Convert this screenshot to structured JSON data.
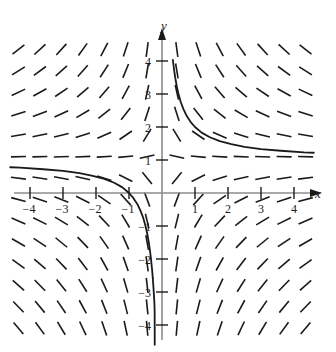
{
  "figure": {
    "title": "",
    "background_color": "#ffffff",
    "width": 336,
    "height": 352
  },
  "axes": {
    "x_axis_label": "x",
    "y_axis_label": "y",
    "x_axis_color": "#8c8c8c",
    "y_axis_color": "#8c8c8c",
    "arrow_color": "#1a1a1a",
    "origin_px": [
      162,
      193
    ],
    "unit_px": 33,
    "x_ticks": [
      {
        "value": -4,
        "label": "−4"
      },
      {
        "value": -3,
        "label": "−3"
      },
      {
        "value": -2,
        "label": "−2"
      },
      {
        "value": -1,
        "label": "−1"
      },
      {
        "value": 1,
        "label": "1"
      },
      {
        "value": 2,
        "label": "2"
      },
      {
        "value": 3,
        "label": "3"
      },
      {
        "value": 4,
        "label": "4"
      }
    ],
    "y_ticks": [
      {
        "value": 4,
        "label": "4"
      },
      {
        "value": 3,
        "label": "3"
      },
      {
        "value": 2,
        "label": "2"
      },
      {
        "value": 1,
        "label": "1"
      },
      {
        "value": -1,
        "label": "−1"
      },
      {
        "value": -2,
        "label": "−2"
      },
      {
        "value": -3,
        "label": "−3"
      },
      {
        "value": -4,
        "label": "−4"
      }
    ]
  },
  "chart_data": {
    "type": "line",
    "title": "",
    "subtitle": "",
    "xlabel": "x",
    "ylabel": "y",
    "xlim": [
      -4.6,
      4.6
    ],
    "ylim": [
      -4.6,
      4.6
    ],
    "grid": false,
    "legend": "none",
    "plot_kind": "slope-field-with-solution-curve",
    "slope_field": {
      "description": "Short line segments showing dy/dx = (1 - y)/x at each lattice point",
      "segment_color": "#1a1a1a",
      "segment_length_px": 15,
      "segment_width_px": 1.6,
      "x_samples": [
        -4.35,
        -3.7,
        -3.05,
        -2.4,
        -1.75,
        -1.1,
        -0.45,
        0.45,
        1.1,
        1.75,
        2.4,
        3.05,
        3.7,
        4.35
      ],
      "y_samples": [
        4.35,
        3.7,
        3.05,
        2.4,
        1.75,
        1.1,
        0.45,
        -0.2,
        -0.85,
        -1.5,
        -2.15,
        -2.8,
        -3.45,
        -4.1
      ],
      "formula": "dy/dx = (1 - y)/x"
    },
    "series": [
      {
        "name": "solution curve",
        "style": "solid",
        "color": "#1a1a1a",
        "width_px": 1.8,
        "equation": "y = 1 + 1/x",
        "asymptotes": {
          "horizontal": 1,
          "vertical": 0
        },
        "branches": [
          {
            "name": "right-branch",
            "x": [
              0.33,
              0.36,
              0.4,
              0.45,
              0.5,
              0.57,
              0.65,
              0.75,
              0.87,
              1.0,
              1.2,
              1.45,
              1.75,
              2.1,
              2.5,
              3.0,
              3.6,
              4.3,
              4.6
            ],
            "y": [
              4.03,
              3.78,
              3.5,
              3.22,
              3.0,
              2.75,
              2.54,
              2.33,
              2.15,
              2.0,
              1.83,
              1.69,
              1.57,
              1.48,
              1.4,
              1.33,
              1.28,
              1.23,
              1.22
            ]
          },
          {
            "name": "left-branch",
            "x": [
              -4.6,
              -4.3,
              -3.6,
              -3.0,
              -2.5,
              -2.1,
              -1.75,
              -1.45,
              -1.2,
              -1.0,
              -0.87,
              -0.75,
              -0.65,
              -0.57,
              -0.5,
              -0.45,
              -0.4,
              -0.36,
              -0.33,
              -0.3,
              -0.28
            ],
            "y": [
              0.78,
              0.77,
              0.72,
              0.67,
              0.6,
              0.52,
              0.43,
              0.31,
              0.17,
              0.0,
              -0.15,
              -0.33,
              -0.54,
              -0.75,
              -1.0,
              -1.22,
              -1.5,
              -1.78,
              -2.03,
              -2.33,
              -2.57
            ]
          },
          {
            "name": "left-branch-tail",
            "x": [
              -0.28,
              -0.26,
              -0.245,
              -0.235,
              -0.228,
              -0.223,
              -0.22
            ],
            "y": [
              -2.57,
              -2.85,
              -3.08,
              -3.26,
              -3.4,
              -3.6,
              -4.6
            ]
          }
        ]
      }
    ],
    "annotations": [
      {
        "text": "x",
        "role": "x-axis-label",
        "position": [
          4.85,
          0.0
        ]
      },
      {
        "text": "y",
        "role": "y-axis-label",
        "position": [
          0.0,
          4.95
        ]
      }
    ]
  }
}
